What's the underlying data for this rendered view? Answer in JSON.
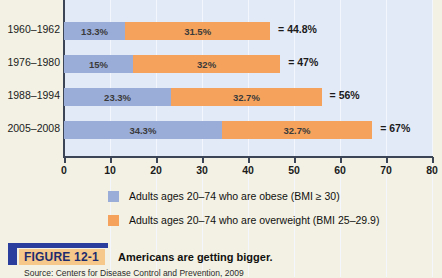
{
  "chart_data": {
    "type": "bar",
    "orientation": "horizontal",
    "stacked": true,
    "title": "Americans are getting bigger.",
    "xlabel": "",
    "ylabel": "",
    "xlim": [
      0,
      80
    ],
    "xticks": [
      0,
      10,
      20,
      30,
      40,
      50,
      60,
      70,
      80
    ],
    "xtick_labels": [
      "0",
      "10",
      "20",
      "30",
      "40",
      "50",
      "60",
      "70",
      "80"
    ],
    "grid": true,
    "legend_position": "bottom",
    "categories": [
      "1960–1962",
      "1976–1980",
      "1988–1994",
      "2005–2008"
    ],
    "series": [
      {
        "name": "Adults ages 20–74 who are obese (BMI ≥ 30)",
        "color": "#9aadd8",
        "values": [
          13.3,
          15,
          23.3,
          34.3
        ],
        "labels": [
          "13.3%",
          "15%",
          "23.3%",
          "34.3%"
        ]
      },
      {
        "name": "Adults ages 20–74 who are overweight (BMI 25–29.9)",
        "color": "#f5a35c",
        "values": [
          31.5,
          32,
          32.7,
          32.7
        ],
        "labels": [
          "31.5%",
          "32%",
          "32.7%",
          "32.7%"
        ]
      }
    ],
    "totals": [
      44.8,
      47,
      56,
      67
    ],
    "total_labels": [
      "= 44.8%",
      "= 47%",
      "= 56%",
      "= 67%"
    ]
  },
  "legend": {
    "items": [
      {
        "label": "Adults ages 20–74 who are obese (BMI ≥ 30)",
        "swatch": "legend-swatch-obese"
      },
      {
        "label": "Adults ages 20–74 who are overweight (BMI 25–29.9)",
        "swatch": "legend-swatch-overweight"
      }
    ]
  },
  "caption": {
    "tag": "FIGURE 12-1",
    "title": "Americans are getting bigger.",
    "source": "Source: Centers for Disease Control and Prevention, 2009"
  },
  "colors": {
    "obese": "#9aadd8",
    "overweight": "#f5a35c",
    "panel": "#e3eaf7",
    "page": "#f2f1e3",
    "axis": "#3c4556",
    "caption_blue": "#2a3f9d",
    "caption_tag_bg": "#f6c98a"
  }
}
